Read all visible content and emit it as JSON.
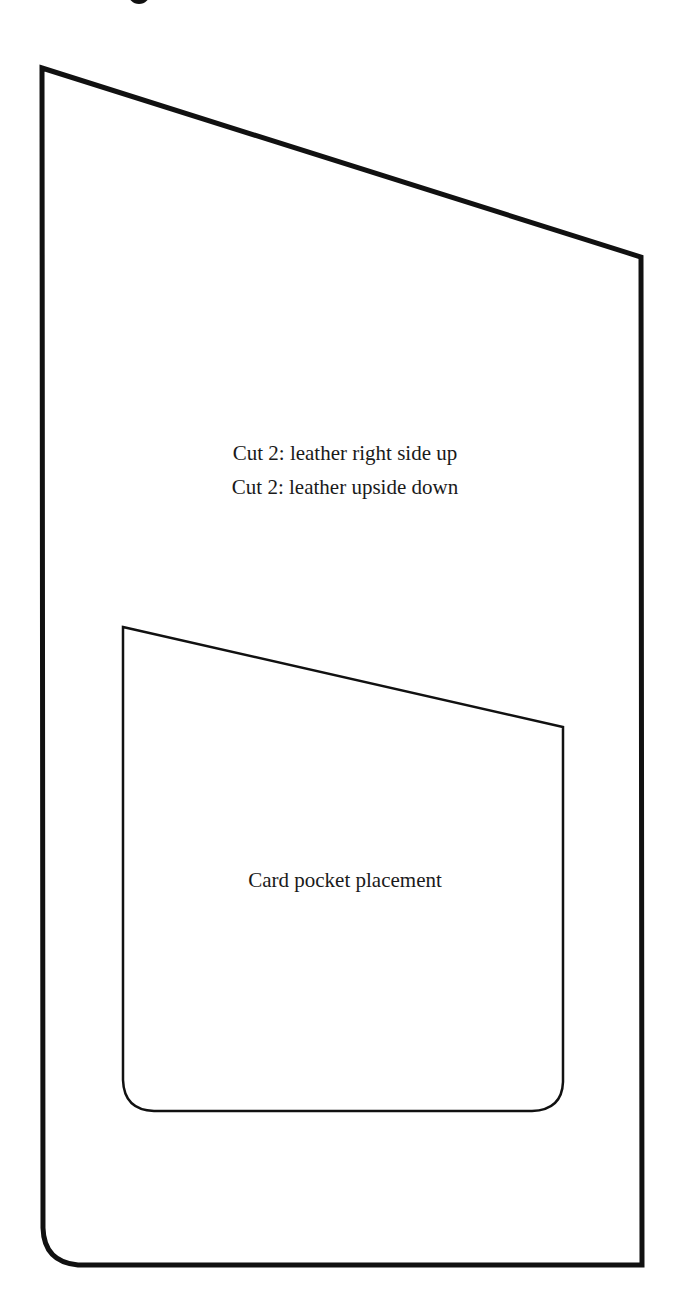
{
  "pattern": {
    "outer_piece": {
      "instructions": [
        "Cut 2: leather right side up",
        "Cut 2: leather upside down"
      ],
      "stroke_color": "#111111"
    },
    "inner_piece": {
      "label": "Card pocket placement",
      "stroke_color": "#111111"
    }
  }
}
